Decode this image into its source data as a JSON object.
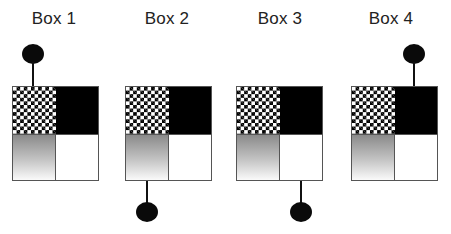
{
  "diagram": {
    "boxes": [
      {
        "label": "Box 1",
        "knob_position": "top-left-quadrant",
        "knob_side": "top"
      },
      {
        "label": "Box 2",
        "knob_position": "bottom-left-quadrant",
        "knob_side": "bottom"
      },
      {
        "label": "Box 3",
        "knob_position": "bottom-right-quadrant",
        "knob_side": "bottom"
      },
      {
        "label": "Box 4",
        "knob_position": "top-right-quadrant",
        "knob_side": "top"
      }
    ],
    "quadrants": {
      "top_left": "checkerboard",
      "top_right": "black",
      "bottom_left": "gray-gradient",
      "bottom_right": "white"
    },
    "colors": {
      "border": "#555555",
      "fill_dark": "#000000",
      "gradient_top": "#8a8a8a",
      "gradient_bottom": "#fafafa",
      "knob": "#0a0a0a"
    }
  }
}
